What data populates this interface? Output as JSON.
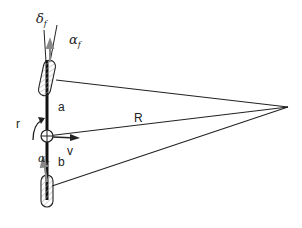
{
  "diagram": {
    "labels": {
      "delta_f": "δ",
      "delta_f_sub": "f",
      "alpha_f": "α",
      "alpha_f_sub": "f",
      "alpha_r": "α",
      "alpha_r_sub": "r",
      "a": "a",
      "b": "b",
      "r": "r",
      "R": "R",
      "v": "v"
    },
    "points": {
      "center_of_gravity": [
        47,
        110
      ],
      "front_wheel_center": [
        47,
        72
      ],
      "rear_wheel_center": [
        47,
        190
      ],
      "turn_center": [
        288,
        107
      ]
    },
    "colors": {
      "line": "#222222",
      "hatch": "#999999",
      "arrow_gray": "#888888"
    }
  }
}
